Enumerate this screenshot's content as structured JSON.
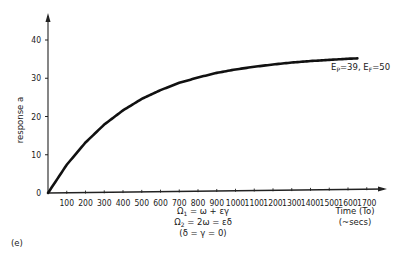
{
  "chart_data": {
    "type": "line",
    "panel_label": "(e)",
    "title": "",
    "xlabel": "Time (To) (~secs)",
    "xlabel_lines": [
      "Time (To)",
      "(~secs)"
    ],
    "ylabel": "response a",
    "xlim": [
      0,
      1750
    ],
    "ylim": [
      0,
      45
    ],
    "x_ticks": [
      100,
      200,
      300,
      400,
      500,
      600,
      700,
      800,
      900,
      1000,
      1100,
      1200,
      1300,
      1400,
      1500,
      1600,
      1700
    ],
    "y_ticks": [
      0,
      10,
      20,
      30,
      40
    ],
    "grid": false,
    "legend": null,
    "annotations": [
      {
        "text": "Ep=39, EF=50",
        "position": "end of curve, right"
      },
      {
        "text": "Ω1 = ω + εγ",
        "position": "below x-axis, center"
      },
      {
        "text": "Ω2 = 2ω = εδ",
        "position": "below x-axis, center"
      },
      {
        "text": "(δ = γ = 0)",
        "position": "below x-axis, center"
      }
    ],
    "series": [
      {
        "name": "response a",
        "x": [
          0,
          100,
          200,
          300,
          400,
          500,
          600,
          700,
          800,
          900,
          1000,
          1100,
          1200,
          1300,
          1400,
          1500,
          1600,
          1650
        ],
        "values": [
          0,
          7.4,
          13.2,
          17.9,
          21.6,
          24.6,
          26.9,
          28.8,
          30.2,
          31.4,
          32.3,
          33.0,
          33.6,
          34.1,
          34.5,
          34.8,
          35.1,
          35.2
        ]
      }
    ]
  },
  "labels": {
    "panel": "(e)",
    "ylabel": "response a",
    "xlabel_line1": "Time (To)",
    "xlabel_line2": "(~secs)",
    "curve_annotation": "Ep=39, EF=50",
    "eq1": "Ω1 = ω + εγ",
    "eq2": "Ω2 = 2ω = εδ",
    "eq3": "(δ = γ = 0)"
  }
}
